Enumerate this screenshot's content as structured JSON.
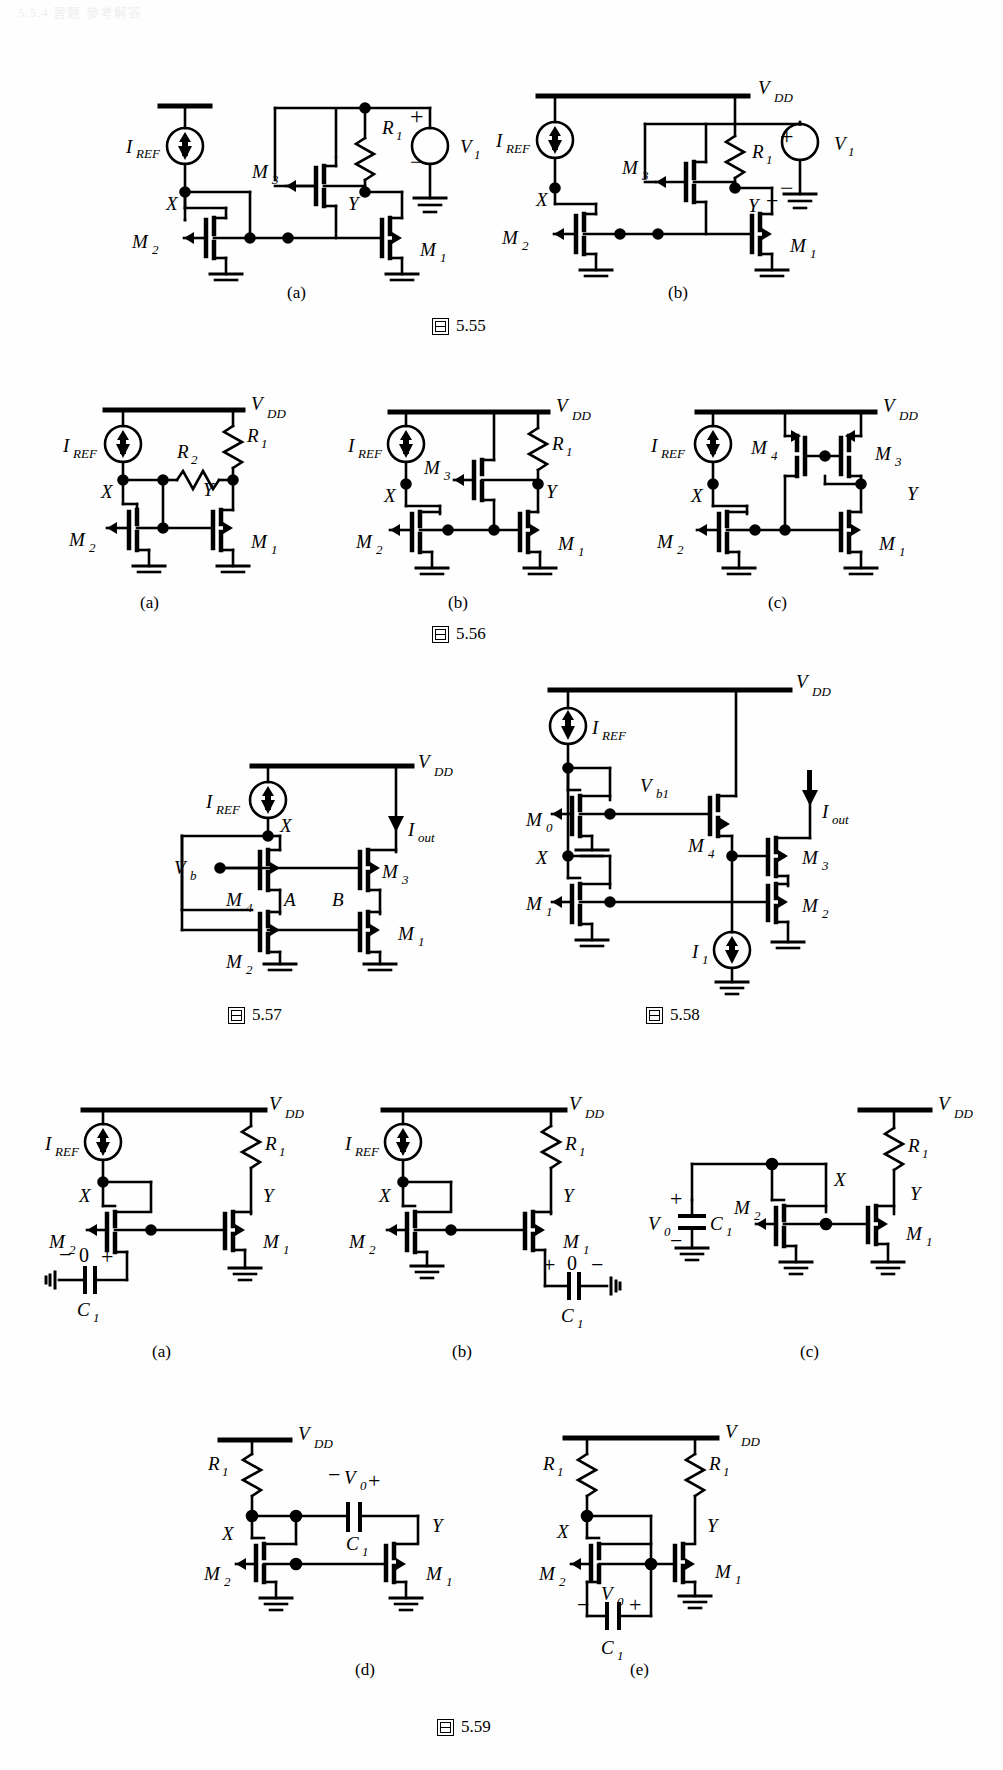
{
  "page": {
    "header_text": "5.5.4  習題 參考解答",
    "width": 1003,
    "height": 1770,
    "ink_color": "#000000",
    "background": "#ffffff"
  },
  "figures": [
    {
      "id": "fig-5-55",
      "caption_mark": "圖",
      "caption_number": "5.55",
      "panels": [
        {
          "key": "a",
          "label": "(a)",
          "devices": [
            "M1",
            "M2",
            "M3"
          ],
          "nodes": [
            "X",
            "Y"
          ],
          "sources": [
            "I_REF",
            "V1"
          ],
          "passives": [
            "R1"
          ],
          "rail": "",
          "labels": {
            "iref": "I",
            "iref_sub": "REF",
            "r1": "R",
            "r1_sub": "1",
            "v1": "V",
            "v1_sub": "1",
            "m1": "M",
            "m1_sub": "1",
            "m2": "M",
            "m2_sub": "2",
            "m3": "M",
            "m3_sub": "3",
            "x": "X",
            "y": "Y",
            "plus": "+",
            "minus": "−"
          }
        },
        {
          "key": "b",
          "label": "(b)",
          "devices": [
            "M1",
            "M2",
            "M3"
          ],
          "nodes": [
            "X",
            "Y"
          ],
          "sources": [
            "I_REF",
            "V1"
          ],
          "passives": [
            "R1"
          ],
          "rail": "VDD",
          "labels": {
            "vdd": "V",
            "vdd_sub": "DD",
            "iref": "I",
            "iref_sub": "REF",
            "r1": "R",
            "r1_sub": "1",
            "v1": "V",
            "v1_sub": "1",
            "m1": "M",
            "m1_sub": "1",
            "m2": "M",
            "m2_sub": "2",
            "m3": "M",
            "m3_sub": "3",
            "x": "X",
            "y": "Y",
            "plus": "+",
            "minus": "−"
          }
        }
      ]
    },
    {
      "id": "fig-5-56",
      "caption_mark": "圖",
      "caption_number": "5.56",
      "panels": [
        {
          "key": "a",
          "label": "(a)",
          "devices": [
            "M1",
            "M2"
          ],
          "nodes": [
            "X",
            "Y"
          ],
          "sources": [
            "I_REF"
          ],
          "passives": [
            "R1",
            "R2"
          ],
          "rail": "VDD",
          "labels": {
            "vdd": "V",
            "vdd_sub": "DD",
            "iref": "I",
            "iref_sub": "REF",
            "r1": "R",
            "r1_sub": "1",
            "r2": "R",
            "r2_sub": "2",
            "m1": "M",
            "m1_sub": "1",
            "m2": "M",
            "m2_sub": "2",
            "x": "X",
            "y": "Y"
          }
        },
        {
          "key": "b",
          "label": "(b)",
          "devices": [
            "M1",
            "M2",
            "M3"
          ],
          "nodes": [
            "X",
            "Y"
          ],
          "sources": [
            "I_REF"
          ],
          "passives": [
            "R1"
          ],
          "rail": "VDD",
          "labels": {
            "vdd": "V",
            "vdd_sub": "DD",
            "iref": "I",
            "iref_sub": "REF",
            "r1": "R",
            "r1_sub": "1",
            "m1": "M",
            "m1_sub": "1",
            "m2": "M",
            "m2_sub": "2",
            "m3": "M",
            "m3_sub": "3",
            "x": "X",
            "y": "Y"
          }
        },
        {
          "key": "c",
          "label": "(c)",
          "devices": [
            "M1",
            "M2",
            "M3",
            "M4"
          ],
          "nodes": [
            "X",
            "Y"
          ],
          "sources": [
            "I_REF"
          ],
          "passives": [],
          "rail": "VDD",
          "labels": {
            "vdd": "V",
            "vdd_sub": "DD",
            "iref": "I",
            "iref_sub": "REF",
            "m1": "M",
            "m1_sub": "1",
            "m2": "M",
            "m2_sub": "2",
            "m3": "M",
            "m3_sub": "3",
            "m4": "M",
            "m4_sub": "4",
            "x": "X",
            "y": "Y"
          }
        }
      ]
    },
    {
      "id": "fig-5-57",
      "caption_mark": "圖",
      "caption_number": "5.57",
      "panels": [
        {
          "key": "only",
          "label": "",
          "devices": [
            "M1",
            "M2",
            "M3",
            "M4"
          ],
          "nodes": [
            "X",
            "A",
            "B"
          ],
          "sources": [
            "I_REF",
            "I_out",
            "Vb"
          ],
          "passives": [],
          "rail": "VDD",
          "labels": {
            "vdd": "V",
            "vdd_sub": "DD",
            "iref": "I",
            "iref_sub": "REF",
            "iout": "I",
            "iout_sub": "out",
            "vb": "V",
            "vb_sub": "b",
            "m1": "M",
            "m1_sub": "1",
            "m2": "M",
            "m2_sub": "2",
            "m3": "M",
            "m3_sub": "3",
            "m4": "M",
            "m4_sub": "4",
            "x": "X",
            "a": "A",
            "b": "B"
          }
        }
      ]
    },
    {
      "id": "fig-5-58",
      "caption_mark": "圖",
      "caption_number": "5.58",
      "panels": [
        {
          "key": "only",
          "label": "",
          "devices": [
            "M0",
            "M1",
            "M2",
            "M3",
            "M4"
          ],
          "nodes": [
            "X"
          ],
          "sources": [
            "I_REF",
            "I_out",
            "I1",
            "Vb1"
          ],
          "passives": [],
          "rail": "VDD",
          "labels": {
            "vdd": "V",
            "vdd_sub": "DD",
            "iref": "I",
            "iref_sub": "REF",
            "iout": "I",
            "iout_sub": "out",
            "i1": "I",
            "i1_sub": "1",
            "vb1": "V",
            "vb1_sub": "b1",
            "m0": "M",
            "m0_sub": "0",
            "m1": "M",
            "m1_sub": "1",
            "m2": "M",
            "m2_sub": "2",
            "m3": "M",
            "m3_sub": "3",
            "m4": "M",
            "m4_sub": "4",
            "x": "X"
          }
        }
      ]
    },
    {
      "id": "fig-5-59",
      "caption_mark": "圖",
      "caption_number": "5.59",
      "panels": [
        {
          "key": "a",
          "label": "(a)",
          "devices": [
            "M1",
            "M2"
          ],
          "nodes": [
            "X",
            "Y"
          ],
          "sources": [
            "I_REF"
          ],
          "passives": [
            "R1",
            "C1"
          ],
          "rail": "VDD",
          "cap_polarity": "− 0 +",
          "labels": {
            "vdd": "V",
            "vdd_sub": "DD",
            "iref": "I",
            "iref_sub": "REF",
            "r1": "R",
            "r1_sub": "1",
            "c1": "C",
            "c1_sub": "1",
            "m1": "M",
            "m1_sub": "1",
            "m2": "M",
            "m2_sub": "2",
            "x": "X",
            "y": "Y",
            "zero": "0",
            "plus": "+",
            "minus": "−"
          }
        },
        {
          "key": "b",
          "label": "(b)",
          "devices": [
            "M1",
            "M2"
          ],
          "nodes": [
            "X",
            "Y"
          ],
          "sources": [
            "I_REF"
          ],
          "passives": [
            "R1",
            "C1"
          ],
          "rail": "VDD",
          "cap_polarity": "+ 0 −",
          "labels": {
            "vdd": "V",
            "vdd_sub": "DD",
            "iref": "I",
            "iref_sub": "REF",
            "r1": "R",
            "r1_sub": "1",
            "c1": "C",
            "c1_sub": "1",
            "m1": "M",
            "m1_sub": "1",
            "m2": "M",
            "m2_sub": "2",
            "x": "X",
            "y": "Y",
            "zero": "0",
            "plus": "+",
            "minus": "−"
          }
        },
        {
          "key": "c",
          "label": "(c)",
          "devices": [
            "M1",
            "M2"
          ],
          "nodes": [
            "X",
            "Y"
          ],
          "sources": [
            "V0"
          ],
          "passives": [
            "R1",
            "C1"
          ],
          "rail": "VDD",
          "labels": {
            "vdd": "V",
            "vdd_sub": "DD",
            "r1": "R",
            "r1_sub": "1",
            "c1": "C",
            "c1_sub": "1",
            "v0": "V",
            "v0_sub": "0",
            "m1": "M",
            "m1_sub": "1",
            "m2": "M",
            "m2_sub": "2",
            "x": "X",
            "y": "Y",
            "plus": "+",
            "minus": "−"
          }
        },
        {
          "key": "d",
          "label": "(d)",
          "devices": [
            "M1",
            "M2"
          ],
          "nodes": [
            "X",
            "Y"
          ],
          "sources": [
            "V0"
          ],
          "passives": [
            "R1",
            "C1"
          ],
          "rail": "VDD",
          "labels": {
            "vdd": "V",
            "vdd_sub": "DD",
            "r1": "R",
            "r1_sub": "1",
            "c1": "C",
            "c1_sub": "1",
            "v0": "V",
            "v0_sub": "0",
            "m1": "M",
            "m1_sub": "1",
            "m2": "M",
            "m2_sub": "2",
            "x": "X",
            "y": "Y",
            "plus": "+",
            "minus": "−"
          }
        },
        {
          "key": "e",
          "label": "(e)",
          "devices": [
            "M1",
            "M2"
          ],
          "nodes": [
            "X",
            "Y"
          ],
          "sources": [
            "V0"
          ],
          "passives": [
            "R1",
            "R1b",
            "C1"
          ],
          "rail": "VDD",
          "labels": {
            "vdd": "V",
            "vdd_sub": "DD",
            "r1": "R",
            "r1_sub": "1",
            "r1b": "R",
            "r1b_sub": "1",
            "c1": "C",
            "c1_sub": "1",
            "v0": "V",
            "v0_sub": "0",
            "m1": "M",
            "m1_sub": "1",
            "m2": "M",
            "m2_sub": "2",
            "x": "X",
            "y": "Y",
            "plus": "+",
            "minus": "−"
          }
        }
      ]
    }
  ]
}
